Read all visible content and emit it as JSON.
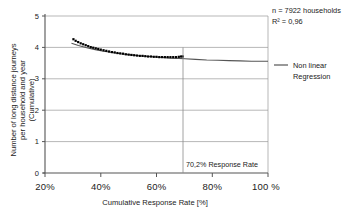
{
  "chart_data": {
    "type": "scatter",
    "title": "",
    "xlabel": "Cumulative Response Rate [%]",
    "ylabel": "Number of long distance journeys per household and year (Cumulative)",
    "ylabel_line1": "Number of long distance journeys",
    "ylabel_line2": "per household and year",
    "ylabel_line3": "(Cumulative)",
    "xlim": [
      20,
      100
    ],
    "ylim": [
      0,
      5
    ],
    "xticks": [
      20,
      40,
      60,
      80,
      100
    ],
    "xtick_labels": [
      "20%",
      "40%",
      "60%",
      "80%",
      "100 %"
    ],
    "yticks": [
      0,
      1,
      2,
      3,
      4,
      5
    ],
    "ytick_labels": [
      "0",
      "1",
      "2",
      "3",
      "4",
      "5"
    ],
    "grid": "horizontal",
    "legend_position": "right",
    "series": [
      {
        "name": "Observed data",
        "type": "scatter",
        "marker": "square",
        "color": "#000000",
        "points": [
          [
            30.2,
            4.26
          ],
          [
            31.0,
            4.21
          ],
          [
            31.9,
            4.17
          ],
          [
            32.8,
            4.13
          ],
          [
            33.7,
            4.1
          ],
          [
            34.6,
            4.07
          ],
          [
            35.5,
            4.04
          ],
          [
            36.4,
            4.01
          ],
          [
            37.3,
            3.99
          ],
          [
            38.2,
            3.97
          ],
          [
            39.1,
            3.95
          ],
          [
            40.0,
            3.93
          ],
          [
            41.0,
            3.91
          ],
          [
            42.0,
            3.89
          ],
          [
            43.0,
            3.87
          ],
          [
            44.0,
            3.85
          ],
          [
            45.0,
            3.84
          ],
          [
            46.0,
            3.82
          ],
          [
            47.0,
            3.81
          ],
          [
            48.0,
            3.8
          ],
          [
            49.0,
            3.78
          ],
          [
            50.0,
            3.77
          ],
          [
            51.0,
            3.76
          ],
          [
            52.0,
            3.75
          ],
          [
            53.0,
            3.74
          ],
          [
            54.0,
            3.73
          ],
          [
            55.0,
            3.73
          ],
          [
            56.0,
            3.72
          ],
          [
            57.0,
            3.71
          ],
          [
            58.0,
            3.71
          ],
          [
            59.0,
            3.7
          ],
          [
            60.0,
            3.7
          ],
          [
            61.0,
            3.69
          ],
          [
            62.0,
            3.69
          ],
          [
            63.0,
            3.69
          ],
          [
            64.0,
            3.69
          ],
          [
            65.0,
            3.69
          ],
          [
            66.0,
            3.69
          ],
          [
            67.0,
            3.69
          ],
          [
            68.0,
            3.7
          ],
          [
            68.8,
            3.71
          ],
          [
            69.4,
            3.71
          ]
        ]
      },
      {
        "name": "Non linear Regression",
        "type": "line",
        "color": "#555555",
        "points": [
          [
            29.5,
            4.13
          ],
          [
            32.0,
            4.06
          ],
          [
            35.0,
            3.99
          ],
          [
            38.0,
            3.93
          ],
          [
            41.0,
            3.88
          ],
          [
            44.0,
            3.84
          ],
          [
            47.0,
            3.8
          ],
          [
            50.0,
            3.77
          ],
          [
            53.0,
            3.74
          ],
          [
            56.0,
            3.72
          ],
          [
            59.0,
            3.7
          ],
          [
            62.0,
            3.68
          ],
          [
            65.0,
            3.66
          ],
          [
            68.0,
            3.65
          ],
          [
            70.2,
            3.64
          ],
          [
            74.0,
            3.62
          ],
          [
            78.0,
            3.6
          ],
          [
            82.0,
            3.59
          ],
          [
            86.0,
            3.58
          ],
          [
            90.0,
            3.57
          ],
          [
            94.0,
            3.56
          ],
          [
            98.0,
            3.56
          ],
          [
            100.0,
            3.56
          ]
        ]
      }
    ],
    "annotations": {
      "sample_size": "n = 7922 households",
      "r_squared": "R² = 0,96",
      "response_rate_marker": "70,2% Response Rate",
      "response_rate_value": 70.2
    },
    "legend": [
      {
        "label_line1": "Non linear",
        "label_line2": "Regression",
        "color": "#555555",
        "marker": "line"
      }
    ]
  }
}
